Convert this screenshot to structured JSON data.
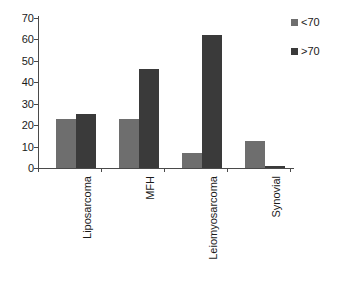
{
  "chart_data": {
    "type": "bar",
    "title": "",
    "subtitle": "",
    "xlabel": "",
    "ylabel": "",
    "categories": [
      "Liposarcoma",
      "MFH",
      "Leiomyosarcoma",
      "Synovial"
    ],
    "series": [
      {
        "name": "<70",
        "color": "#6e6e6e",
        "values": [
          23,
          23,
          7,
          12.5
        ]
      },
      {
        "name": ">70",
        "color": "#3a3a3a",
        "values": [
          25,
          46,
          62,
          1
        ]
      }
    ],
    "ylim": [
      0,
      70
    ],
    "yticks": [
      0,
      10,
      20,
      30,
      40,
      50,
      60,
      70
    ],
    "ytick_labels": [
      "0",
      "10",
      "20",
      "30",
      "40",
      "50",
      "60",
      "70"
    ],
    "grid": false,
    "legend_position": "top-right",
    "legend_entries": [
      "<70",
      ">70"
    ],
    "background": "#ffffff",
    "axis_color": "#4a4a4a",
    "text_color": "#1a1a1a"
  }
}
